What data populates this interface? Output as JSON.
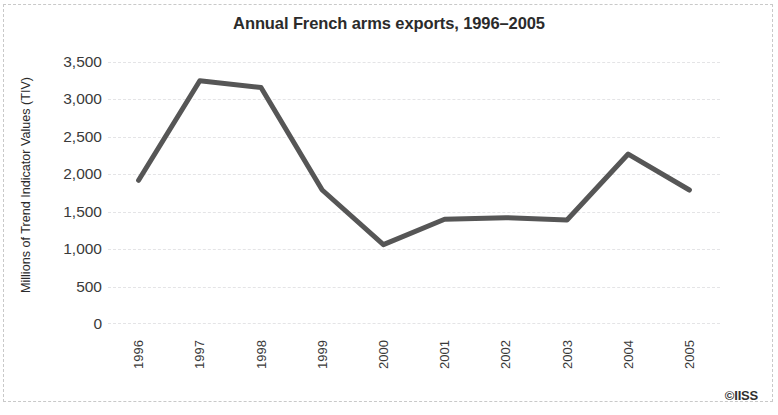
{
  "chart_data": {
    "type": "line",
    "title": "Annual French arms exports, 1996–2005",
    "xlabel": "",
    "ylabel": "Millions of Trend Indicator Values (TIV)",
    "categories": [
      "1996",
      "1997",
      "1998",
      "1999",
      "2000",
      "2001",
      "2002",
      "2003",
      "2004",
      "2005"
    ],
    "values": [
      1920,
      3250,
      3160,
      1790,
      1060,
      1400,
      1420,
      1390,
      2270,
      1790
    ],
    "series": [
      {
        "name": "French arms exports",
        "values": [
          1920,
          3250,
          3160,
          1790,
          1060,
          1400,
          1420,
          1390,
          2270,
          1790
        ]
      }
    ],
    "ylim": [
      0,
      3500
    ],
    "yticks": [
      0,
      500,
      1000,
      1500,
      2000,
      2500,
      3000,
      3500
    ],
    "ytick_labels": [
      "0",
      "500",
      "1,000",
      "1,500",
      "2,000",
      "2,500",
      "3,000",
      "3,500"
    ],
    "grid": true,
    "legend": false,
    "line_color": "#565656",
    "grid_color": "#e4e4e6",
    "text_color": "#2b2b2b"
  },
  "credit": {
    "text": "©IISS"
  }
}
